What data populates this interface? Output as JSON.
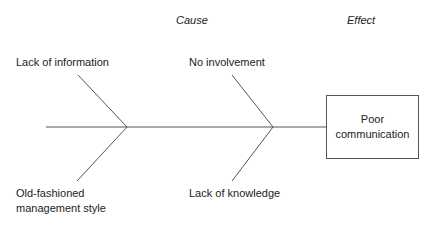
{
  "headers": {
    "cause": "Cause",
    "effect": "Effect"
  },
  "causes": [
    {
      "label": "Lack of information",
      "position": "top-left"
    },
    {
      "label": "No involvement",
      "position": "top-right"
    },
    {
      "label": "Old-fashioned",
      "label2": "management style",
      "position": "bottom-left"
    },
    {
      "label": "Lack of knowledge",
      "position": "bottom-right"
    }
  ],
  "effect": {
    "line1": "Poor",
    "line2": "communication"
  },
  "colors": {
    "line": "#555555",
    "text": "#222222"
  }
}
